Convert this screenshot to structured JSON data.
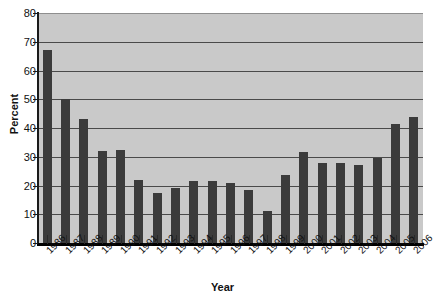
{
  "chart_data": {
    "type": "bar",
    "title": "",
    "xlabel": "Year",
    "ylabel": "Percent",
    "ylim": [
      0,
      80
    ],
    "ytick_values": [
      0,
      10,
      20,
      30,
      40,
      50,
      60,
      70,
      80
    ],
    "ytick_labels": [
      "0",
      "10",
      "20",
      "30",
      "40",
      "50",
      "60",
      "70",
      "80"
    ],
    "grid": true,
    "legend": "none",
    "bar_color": "#3b3b3b",
    "plot_background": "#c9c9c9",
    "categories": [
      "1986",
      "1987",
      "1988",
      "1989",
      "1990",
      "1991",
      "1992",
      "1993",
      "1994",
      "1995",
      "1996",
      "1997",
      "1998",
      "1999",
      "2000",
      "2001",
      "2002",
      "2003",
      "2004",
      "2005",
      "2006"
    ],
    "values": [
      67,
      50,
      43,
      32,
      32.5,
      22,
      17.5,
      19,
      21.5,
      21.5,
      21,
      18.5,
      11,
      23.5,
      31.5,
      28,
      28,
      27,
      29.5,
      41.5,
      44
    ]
  },
  "axis": {
    "y_title": "Percent",
    "x_title": "Year"
  }
}
